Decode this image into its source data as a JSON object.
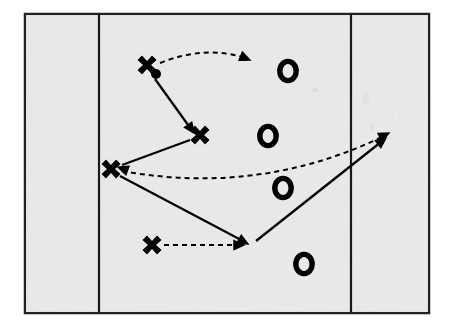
{
  "diagram": {
    "type": "sports-play-diagram",
    "colors": {
      "field_fill": "#ededed",
      "field_border": "#222222",
      "yard_line": "#1a1a1a",
      "marker": "#000000",
      "page_background": "#ffffff"
    },
    "field": {
      "x": 25,
      "y": 14,
      "width": 404,
      "height": 299,
      "border_width": 2.5,
      "yard_lines": [
        {
          "name": "left-yard-line",
          "x": 99
        },
        {
          "name": "right-yard-line",
          "x": 351
        }
      ]
    },
    "offense_markers": [
      {
        "label": "X",
        "name": "offense-player-1-ball-carrier",
        "x": 147,
        "y": 65,
        "has_ball": true,
        "ball": {
          "x": 156,
          "y": 74,
          "r": 5
        }
      },
      {
        "label": "X",
        "name": "offense-player-2",
        "x": 200,
        "y": 135,
        "has_ball": false
      },
      {
        "label": "X",
        "name": "offense-player-3",
        "x": 111,
        "y": 169,
        "has_ball": false
      },
      {
        "label": "X",
        "name": "offense-player-4",
        "x": 152,
        "y": 245,
        "has_ball": false
      }
    ],
    "defense_markers": [
      {
        "label": "O",
        "name": "defense-player-1",
        "x": 288,
        "y": 71
      },
      {
        "label": "O",
        "name": "defense-player-2",
        "x": 268,
        "y": 136
      },
      {
        "label": "O",
        "name": "defense-player-3",
        "x": 283,
        "y": 188
      },
      {
        "label": "O",
        "name": "defense-player-4",
        "x": 304,
        "y": 264
      }
    ],
    "routes": [
      {
        "name": "route-pass-arc-top",
        "style": "dashed",
        "description": "Pass arc from ball carrier curving right",
        "path": "M 160 63 Q 205 45 246 58",
        "arrow_at": {
          "x": 250,
          "y": 60,
          "angle": 22
        }
      },
      {
        "name": "route-run-carrier-to-player2",
        "style": "solid",
        "description": "Run from ball carrier down-right to player 2",
        "path": "M 155 79 L 191 129",
        "arrow_at": {
          "x": 194,
          "y": 133,
          "angle": 54
        }
      },
      {
        "name": "route-run-player2-to-player3",
        "style": "solid",
        "description": "Run from player 2 back-left to player 3",
        "path": "M 190 140 L 122 165",
        "arrow_at": {
          "x": 118,
          "y": 167,
          "angle": 200
        }
      },
      {
        "name": "route-pass-long-right",
        "style": "dashed",
        "description": "Long pass arc from player 3 to deep right",
        "path": "M 122 171 Q 260 196 384 136",
        "arrow_at": {
          "x": 389,
          "y": 133,
          "angle": -26
        }
      },
      {
        "name": "route-run-player3-to-flat",
        "style": "solid",
        "description": "Run from player 3 down-right to the flat",
        "path": "M 120 176 L 243 241",
        "arrow_at": {
          "x": 248,
          "y": 244,
          "angle": 28
        }
      },
      {
        "name": "route-pass-player4-to-flat",
        "style": "dashed",
        "description": "Short pass from player 4 to the flat",
        "path": "M 164 245 L 239 245",
        "arrow_at": {
          "x": 244,
          "y": 245,
          "angle": 0
        }
      },
      {
        "name": "route-run-flat-to-deep-right",
        "style": "solid",
        "description": "Run from the flat up-right to deep right",
        "path": "M 256 241 L 381 142",
        "arrow_at": {
          "x": 386,
          "y": 138,
          "angle": -38
        }
      }
    ],
    "legend": {
      "offense_symbol": "X",
      "defense_symbol": "O",
      "ball_symbol": "●",
      "solid_line_meaning": "Run / movement",
      "dashed_line_meaning": "Pass"
    }
  }
}
